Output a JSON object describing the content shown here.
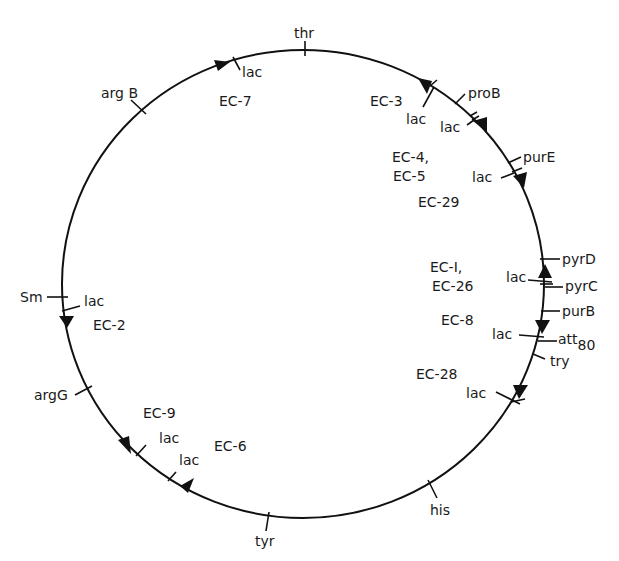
{
  "diagram": {
    "type": "circular genetic map",
    "colors": {
      "line": "#111111",
      "text": "#1a1a1a",
      "background": "#ffffff"
    },
    "markers": [
      {
        "id": "thr",
        "label": "thr"
      },
      {
        "id": "proB",
        "label": "proB"
      },
      {
        "id": "purE",
        "label": "purE"
      },
      {
        "id": "pyrD",
        "label": "pyrD"
      },
      {
        "id": "pyrC",
        "label": "pyrC"
      },
      {
        "id": "purB",
        "label": "purB"
      },
      {
        "id": "att80",
        "label": "att",
        "sub": "80"
      },
      {
        "id": "try",
        "label": "try"
      },
      {
        "id": "his",
        "label": "his"
      },
      {
        "id": "tyr",
        "label": "tyr"
      },
      {
        "id": "argG",
        "label": "argG"
      },
      {
        "id": "Sm",
        "label": "Sm"
      },
      {
        "id": "argB",
        "label": "arg B"
      }
    ],
    "lac_label": "lac",
    "strains": [
      {
        "id": "EC-7",
        "label": "EC-7"
      },
      {
        "id": "EC-3",
        "label": "EC-3"
      },
      {
        "id": "EC-4-5",
        "line1": "EC-4,",
        "line2": "EC-5"
      },
      {
        "id": "EC-29",
        "label": "EC-29"
      },
      {
        "id": "EC-1-26",
        "line1": "EC-I,",
        "line2": "EC-26"
      },
      {
        "id": "EC-8",
        "label": "EC-8"
      },
      {
        "id": "EC-28",
        "label": "EC-28"
      },
      {
        "id": "EC-6",
        "label": "EC-6"
      },
      {
        "id": "EC-9",
        "label": "EC-9"
      },
      {
        "id": "EC-2",
        "label": "EC-2"
      }
    ]
  }
}
